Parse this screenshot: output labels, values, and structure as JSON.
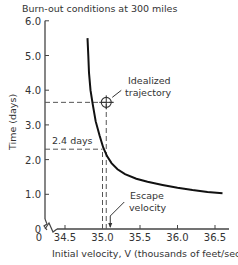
{
  "chart_data": {
    "type": "line",
    "title": "Burn-out conditions at 300 miles",
    "xlabel": "Initial velocity, V (thousands of feet/sec)",
    "ylabel": "Time (days)",
    "xlim": [
      34.5,
      36.6
    ],
    "ylim": [
      0,
      6.0
    ],
    "x_ticks": [
      "34.5",
      "35.0",
      "35.5",
      "36.0",
      "36.5"
    ],
    "x_tick_values": [
      34.5,
      35.0,
      35.5,
      36.0,
      36.5
    ],
    "x_origin_label": "0",
    "y_ticks": [
      "0",
      "1.0",
      "2.0",
      "3.0",
      "4.0",
      "5.0",
      "6.0"
    ],
    "y_tick_values": [
      0,
      1,
      2,
      3,
      4,
      5,
      6
    ],
    "grid": false,
    "axis_break": true,
    "series": [
      {
        "name": "Time vs initial velocity",
        "x": [
          34.8,
          34.81,
          34.82,
          34.84,
          34.87,
          34.91,
          34.96,
          35.01,
          35.06,
          35.12,
          35.2,
          35.3,
          35.45,
          35.6,
          35.8,
          36.0,
          36.2,
          36.4,
          36.6
        ],
        "y": [
          5.5,
          5.0,
          4.5,
          4.0,
          3.6,
          3.1,
          2.7,
          2.35,
          2.1,
          1.9,
          1.72,
          1.58,
          1.45,
          1.36,
          1.27,
          1.19,
          1.12,
          1.07,
          1.03
        ]
      }
    ],
    "annotations": [
      {
        "text": "Idealized",
        "text2": "trajectory",
        "point": [
          35.05,
          3.65
        ],
        "marker": "circle-cross"
      },
      {
        "text": "2.4 days",
        "point": [
          35.0,
          2.3
        ]
      },
      {
        "text": "Escape",
        "text2": "velocity",
        "point": [
          35.05,
          0
        ]
      }
    ],
    "reference_lines": [
      {
        "orientation": "horizontal",
        "y": 3.65,
        "x_from": 34.5,
        "x_to": 35.15
      },
      {
        "orientation": "horizontal",
        "y": 2.3,
        "x_from": 34.5,
        "x_to": 35.0
      },
      {
        "orientation": "vertical",
        "x": 35.0,
        "y_from": 0,
        "y_to": 2.3
      },
      {
        "orientation": "vertical",
        "x": 35.05,
        "y_from": 0,
        "y_to": 3.65
      }
    ]
  }
}
